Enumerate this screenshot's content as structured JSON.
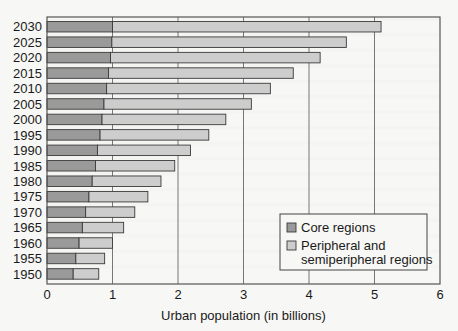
{
  "chart_data": {
    "type": "bar",
    "orientation": "horizontal",
    "stacked": true,
    "title": "",
    "xlabel": "Urban population (in billions)",
    "ylabel": "",
    "xlim": [
      0,
      6
    ],
    "xticks": [
      0,
      1,
      2,
      3,
      4,
      5,
      6
    ],
    "grid": "vertical",
    "legend_position": "lower right (inside plot)",
    "categories": [
      "2030",
      "2025",
      "2020",
      "2015",
      "2010",
      "2005",
      "2000",
      "1995",
      "1990",
      "1985",
      "1980",
      "1975",
      "1970",
      "1965",
      "1960",
      "1955",
      "1950"
    ],
    "series": [
      {
        "name": "Core regions",
        "color": "#9a9a9a",
        "values": [
          1.0,
          0.99,
          0.97,
          0.94,
          0.91,
          0.87,
          0.84,
          0.81,
          0.77,
          0.74,
          0.69,
          0.64,
          0.59,
          0.54,
          0.49,
          0.44,
          0.4
        ]
      },
      {
        "name": "Peripheral and semiperipheral regions",
        "color": "#cdcdcd",
        "values": [
          4.1,
          3.58,
          3.2,
          2.82,
          2.5,
          2.25,
          1.89,
          1.66,
          1.42,
          1.21,
          1.05,
          0.9,
          0.75,
          0.63,
          0.51,
          0.44,
          0.39
        ]
      }
    ],
    "totals": [
      5.1,
      4.57,
      4.17,
      3.76,
      3.41,
      3.12,
      2.73,
      2.47,
      2.19,
      1.95,
      1.74,
      1.54,
      1.34,
      1.17,
      1.0,
      0.88,
      0.79
    ]
  },
  "legend": {
    "items": [
      {
        "label_lines": [
          "Core regions"
        ],
        "color": "#9a9a9a"
      },
      {
        "label_lines": [
          "Peripheral and",
          "semiperipheral regions"
        ],
        "color": "#cdcdcd"
      }
    ]
  }
}
